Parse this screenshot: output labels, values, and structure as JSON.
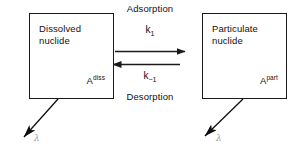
{
  "diagram": {
    "background_color": "#ffffff",
    "stroke_color": "#1a1a1a",
    "lambda_color": "#9a9a9a",
    "boxes": [
      {
        "id": "dissolved",
        "title": "Dissolved\nnuclide",
        "symbol_base": "A",
        "symbol_sup": "diss"
      },
      {
        "id": "particulate",
        "title": "Particulate\nnuclide",
        "symbol_base": "A",
        "symbol_sup": "part"
      }
    ],
    "processes": {
      "forward_label": "Adsorption",
      "forward_rate_base": "k",
      "forward_rate_sub": "1",
      "reverse_label": "Desorption",
      "reverse_rate_base": "k",
      "reverse_rate_sub": "−1"
    },
    "decay": {
      "left_symbol": "λ",
      "right_symbol": "λ"
    }
  }
}
